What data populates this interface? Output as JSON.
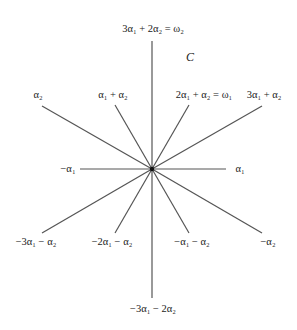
{
  "diagram": {
    "title": "C",
    "center": [
      152,
      169
    ],
    "colors": {
      "line": "#555555",
      "text": "#222222",
      "origin": "#111111"
    },
    "roots": [
      {
        "name": "alpha1",
        "end": [
          226,
          169
        ],
        "label": "α₁",
        "label_pos": [
          240,
          172
        ],
        "anchor": "middle"
      },
      {
        "name": "neg-alpha1",
        "end": [
          80,
          169
        ],
        "label": "−α₁",
        "label_pos": [
          68,
          172
        ],
        "anchor": "middle"
      },
      {
        "name": "alpha1-plus-alpha2",
        "end": [
          115,
          105
        ],
        "label": "α₁ + α₂",
        "label_pos": [
          113,
          98
        ],
        "anchor": "middle"
      },
      {
        "name": "2alpha1-plus-alpha2",
        "end": [
          189,
          105
        ],
        "label": "2α₁ + α₂ = ω₁",
        "label_pos": [
          204,
          98
        ],
        "anchor": "middle"
      },
      {
        "name": "neg-2alpha1-minus-alpha2",
        "end": [
          115,
          233
        ],
        "label": "−2α₁ − α₂",
        "label_pos": [
          112,
          245
        ],
        "anchor": "middle"
      },
      {
        "name": "neg-alpha1-minus-alpha2",
        "end": [
          189,
          233
        ],
        "label": "−α₁ − α₂",
        "label_pos": [
          192,
          245
        ],
        "anchor": "middle"
      },
      {
        "name": "3alpha1-plus-2alpha2",
        "end": [
          152,
          41
        ],
        "label": "3α₁ + 2α₂ = ω₂",
        "label_pos": [
          153,
          32
        ],
        "anchor": "middle"
      },
      {
        "name": "neg-3alpha1-minus-2alpha2",
        "end": [
          152,
          298
        ],
        "label": "−3α₁ − 2α₂",
        "label_pos": [
          153,
          312
        ],
        "anchor": "middle"
      },
      {
        "name": "alpha2",
        "end": [
          42,
          106
        ],
        "label": "α₂",
        "label_pos": [
          38,
          98
        ],
        "anchor": "middle"
      },
      {
        "name": "3alpha1-plus-alpha2",
        "end": [
          262,
          106
        ],
        "label": "3α₁ + α₂",
        "label_pos": [
          264,
          98
        ],
        "anchor": "middle"
      },
      {
        "name": "neg-3alpha1-minus-alpha2",
        "end": [
          42,
          233
        ],
        "label": "−3α₁ − α₂",
        "label_pos": [
          36,
          245
        ],
        "anchor": "middle"
      },
      {
        "name": "neg-alpha2",
        "end": [
          262,
          233
        ],
        "label": "−α₂",
        "label_pos": [
          268,
          245
        ],
        "anchor": "middle"
      }
    ],
    "title_pos": [
      190,
      61
    ]
  }
}
